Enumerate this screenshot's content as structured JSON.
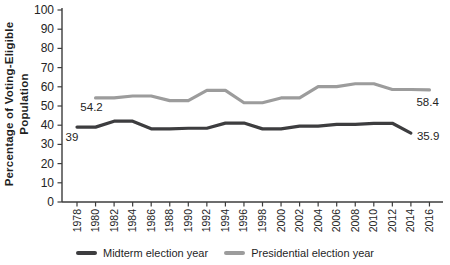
{
  "figure": {
    "background": "#ffffff",
    "axis_color": "#3c3c3c",
    "text_color": "#242424"
  },
  "chart_data": {
    "type": "line",
    "title": "",
    "xlabel": "",
    "ylabel": "Percentage of Voting-Eligible Population",
    "ylabel_lines": [
      "Percentage of Voting-Eligible",
      "Population"
    ],
    "ylim": [
      0,
      100
    ],
    "yticks": [
      0,
      10,
      20,
      30,
      40,
      50,
      60,
      70,
      80,
      90,
      100
    ],
    "xticks": [
      1978,
      1980,
      1982,
      1984,
      1986,
      1988,
      1990,
      1992,
      1994,
      1996,
      1998,
      2000,
      2002,
      2004,
      2006,
      2008,
      2010,
      2012,
      2014,
      2016
    ],
    "grid": false,
    "legend_position": "bottom",
    "line_style": "step-hold-2yr",
    "series": [
      {
        "name": "Midterm election year",
        "color": "#3d3d3f",
        "x": [
          1978,
          1982,
          1986,
          1990,
          1994,
          1998,
          2002,
          2006,
          2010,
          2014
        ],
        "y": [
          39.0,
          42.1,
          38.1,
          38.4,
          41.1,
          38.1,
          39.5,
          40.4,
          41.0,
          35.9
        ]
      },
      {
        "name": "Presidential election year",
        "color": "#9c9c9c",
        "x": [
          1980,
          1984,
          1988,
          1992,
          1996,
          2000,
          2004,
          2008,
          2012,
          2016
        ],
        "y": [
          54.2,
          55.2,
          52.8,
          58.1,
          51.7,
          54.2,
          60.1,
          61.6,
          58.6,
          58.4
        ]
      }
    ],
    "annotations": [
      {
        "text": "39",
        "series": 0,
        "year": 1978,
        "dx": -5,
        "dy": 14,
        "anchor": "middle"
      },
      {
        "text": "54.2",
        "series": 1,
        "year": 1980,
        "dx": -4,
        "dy": 13,
        "anchor": "middle"
      },
      {
        "text": "58.4",
        "series": 1,
        "year": 2016,
        "dx": -13,
        "dy": 16,
        "anchor": "start"
      },
      {
        "text": "35.9",
        "series": 0,
        "year": 2014,
        "dx": 6,
        "dy": 7,
        "anchor": "start"
      }
    ]
  }
}
